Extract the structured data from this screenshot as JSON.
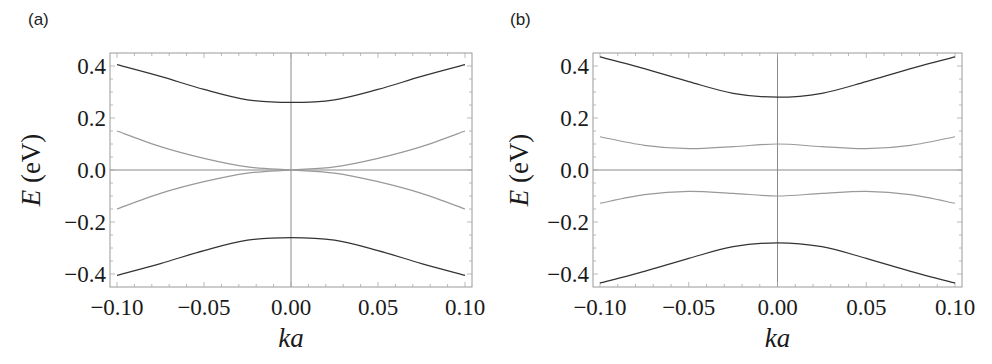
{
  "chart_data": [
    {
      "panel": "(a)",
      "type": "line",
      "title": "",
      "xlabel": "ka",
      "ylabel": "E (eV)",
      "xlim": [
        -0.1,
        0.1
      ],
      "ylim": [
        -0.45,
        0.45
      ],
      "xticks": [
        -0.1,
        -0.05,
        0.0,
        0.05,
        0.1
      ],
      "xtick_labels": [
        "−0.10",
        "−0.05",
        "0.00",
        "0.05",
        "0.10"
      ],
      "yticks": [
        0.4,
        0.2,
        0.0,
        -0.2,
        -0.4
      ],
      "ytick_labels": [
        "0.4",
        "0.2",
        "0.0",
        "−0.2",
        "−0.4"
      ],
      "grid": false,
      "zero_lines": true,
      "legend": null,
      "series": [
        {
          "name": "upper band",
          "color": "#333333",
          "x": [
            -0.1,
            -0.075,
            -0.05,
            -0.025,
            0.0,
            0.025,
            0.05,
            0.075,
            0.1
          ],
          "y": [
            0.405,
            0.36,
            0.31,
            0.27,
            0.26,
            0.27,
            0.31,
            0.36,
            0.405
          ]
        },
        {
          "name": "inner band 1",
          "color": "#999999",
          "x": [
            -0.1,
            -0.075,
            -0.05,
            -0.025,
            0.0,
            0.025,
            0.05,
            0.075,
            0.1
          ],
          "y": [
            0.15,
            0.09,
            0.045,
            0.012,
            0.0,
            -0.012,
            -0.045,
            -0.09,
            -0.15
          ]
        },
        {
          "name": "inner band 2",
          "color": "#999999",
          "x": [
            -0.1,
            -0.075,
            -0.05,
            -0.025,
            0.0,
            0.025,
            0.05,
            0.075,
            0.1
          ],
          "y": [
            -0.15,
            -0.09,
            -0.045,
            -0.012,
            0.0,
            0.012,
            0.045,
            0.09,
            0.15
          ]
        },
        {
          "name": "lower band",
          "color": "#333333",
          "x": [
            -0.1,
            -0.075,
            -0.05,
            -0.025,
            0.0,
            0.025,
            0.05,
            0.075,
            0.1
          ],
          "y": [
            -0.405,
            -0.36,
            -0.31,
            -0.27,
            -0.26,
            -0.27,
            -0.31,
            -0.36,
            -0.405
          ]
        }
      ]
    },
    {
      "panel": "(b)",
      "type": "line",
      "title": "",
      "xlabel": "ka",
      "ylabel": "E (eV)",
      "xlim": [
        -0.1,
        0.1
      ],
      "ylim": [
        -0.45,
        0.45
      ],
      "xticks": [
        -0.1,
        -0.05,
        0.0,
        0.05,
        0.1
      ],
      "xtick_labels": [
        "−0.10",
        "−0.05",
        "0.00",
        "0.05",
        "0.10"
      ],
      "yticks": [
        0.4,
        0.2,
        0.0,
        -0.2,
        -0.4
      ],
      "ytick_labels": [
        "0.4",
        "0.2",
        "0.0",
        "−0.2",
        "−0.4"
      ],
      "grid": false,
      "zero_lines": true,
      "legend": null,
      "series": [
        {
          "name": "upper band",
          "color": "#333333",
          "x": [
            -0.1,
            -0.075,
            -0.05,
            -0.025,
            0.0,
            0.025,
            0.05,
            0.075,
            0.1
          ],
          "y": [
            0.435,
            0.39,
            0.34,
            0.295,
            0.28,
            0.295,
            0.34,
            0.39,
            0.435
          ]
        },
        {
          "name": "inner upper band",
          "color": "#999999",
          "x": [
            -0.1,
            -0.075,
            -0.05,
            -0.025,
            0.0,
            0.025,
            0.05,
            0.075,
            0.1
          ],
          "y": [
            0.128,
            0.095,
            0.082,
            0.09,
            0.1,
            0.09,
            0.082,
            0.095,
            0.128
          ]
        },
        {
          "name": "inner lower band",
          "color": "#999999",
          "x": [
            -0.1,
            -0.075,
            -0.05,
            -0.025,
            0.0,
            0.025,
            0.05,
            0.075,
            0.1
          ],
          "y": [
            -0.128,
            -0.095,
            -0.082,
            -0.09,
            -0.1,
            -0.09,
            -0.082,
            -0.095,
            -0.128
          ]
        },
        {
          "name": "lower band",
          "color": "#333333",
          "x": [
            -0.1,
            -0.075,
            -0.05,
            -0.025,
            0.0,
            0.025,
            0.05,
            0.075,
            0.1
          ],
          "y": [
            -0.435,
            -0.39,
            -0.34,
            -0.295,
            -0.28,
            -0.295,
            -0.34,
            -0.39,
            -0.435
          ]
        }
      ]
    }
  ],
  "panels": [
    {
      "label": "(a)",
      "ylabel_var": "E",
      "ylabel_unit": " (eV)",
      "xlabel": "ka"
    },
    {
      "label": "(b)",
      "ylabel_var": "E",
      "ylabel_unit": " (eV)",
      "xlabel": "ka"
    }
  ]
}
